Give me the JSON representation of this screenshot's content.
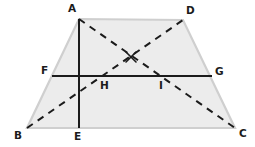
{
  "figure": {
    "name": "trapezoid-with-diagonals-and-midsegment",
    "canvas": {
      "width": 255,
      "height": 147
    },
    "background_color": "#ffffff"
  },
  "style": {
    "fill_color": "#ececec",
    "outline_color": "#cfcfcf",
    "outline_width": 2.2,
    "solid_line_color": "#1b1b1b",
    "solid_line_width": 2.0,
    "dashed_line_color": "#1b1b1b",
    "dashed_line_width": 2.0,
    "dash_pattern": "7 6",
    "label_color": "#1b1b1b",
    "label_font_size": 10.5
  },
  "points": {
    "A": {
      "label": "A",
      "x": 79,
      "y": 19,
      "label_x": 68,
      "label_y": 12
    },
    "B": {
      "label": "B",
      "x": 27,
      "y": 128,
      "label_x": 14,
      "label_y": 139
    },
    "C": {
      "label": "C",
      "x": 235,
      "y": 128,
      "label_x": 239,
      "label_y": 137
    },
    "D": {
      "label": "D",
      "x": 183,
      "y": 20,
      "label_x": 186,
      "label_y": 14
    },
    "E": {
      "label": "E",
      "x": 79,
      "y": 128,
      "label_x": 74,
      "label_y": 140
    },
    "F": {
      "label": "F",
      "x": 52,
      "y": 76,
      "label_x": 41,
      "label_y": 74
    },
    "G": {
      "label": "G",
      "x": 212,
      "y": 76,
      "label_x": 215,
      "label_y": 75
    },
    "H": {
      "label": "H",
      "x": 100,
      "y": 76,
      "label_x": 100,
      "label_y": 89
    },
    "I": {
      "label": "I",
      "x": 160,
      "y": 76,
      "label_x": 159,
      "label_y": 89
    },
    "X": {
      "label": "",
      "x": 131,
      "y": 57,
      "label_x": 131,
      "label_y": 57
    }
  },
  "shapes": {
    "trapezoid": {
      "name": "trapezoid-ABCD",
      "vertices": [
        "A",
        "D",
        "C",
        "B"
      ],
      "polygon_points": "79,19 183,20 235,128 27,128"
    }
  },
  "segments": [
    {
      "name": "segment-AE",
      "from": "A",
      "to": "E",
      "style": "solid",
      "description": "vertical altitude from A to E"
    },
    {
      "name": "segment-FG",
      "from": "F",
      "to": "G",
      "style": "solid",
      "description": "horizontal midsegment from F to G"
    },
    {
      "name": "segment-BD",
      "from": "B",
      "to": "D",
      "style": "dashed",
      "description": "diagonal from B to D"
    },
    {
      "name": "segment-AC",
      "from": "A",
      "to": "C",
      "style": "dashed",
      "description": "diagonal from A to C"
    }
  ],
  "marks": [
    {
      "name": "diagonal-intersection-cross",
      "glyph": "x-cross",
      "x": 131,
      "y": 57,
      "size": 5
    }
  ],
  "labels": [
    {
      "name": "vertex-label-A",
      "text": "A",
      "x": 68,
      "y": 12
    },
    {
      "name": "vertex-label-D",
      "text": "D",
      "x": 186,
      "y": 14
    },
    {
      "name": "vertex-label-F",
      "text": "F",
      "x": 41,
      "y": 74
    },
    {
      "name": "vertex-label-G",
      "text": "G",
      "x": 215,
      "y": 75
    },
    {
      "name": "vertex-label-H",
      "text": "H",
      "x": 100,
      "y": 89
    },
    {
      "name": "vertex-label-I",
      "text": "I",
      "x": 159,
      "y": 89
    },
    {
      "name": "vertex-label-B",
      "text": "B",
      "x": 14,
      "y": 139
    },
    {
      "name": "vertex-label-E",
      "text": "E",
      "x": 74,
      "y": 140
    },
    {
      "name": "vertex-label-C",
      "text": "C",
      "x": 239,
      "y": 137
    }
  ]
}
